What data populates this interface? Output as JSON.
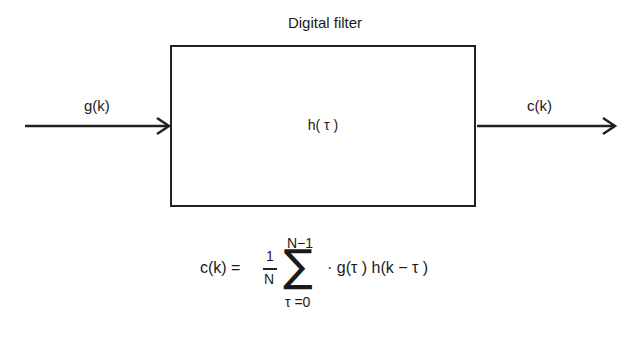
{
  "diagram": {
    "title": "Digital filter",
    "block_label": "h( τ )",
    "input_label": "g(k)",
    "output_label": "c(k)",
    "equation": {
      "lhs": "c(k) =",
      "fraction_numerator": "1",
      "fraction_denominator": "N",
      "sum_symbol": "∑",
      "sum_upper": "N−1",
      "sum_lower": "τ =0",
      "summand": "· g(τ ) h(k − τ )"
    },
    "colors": {
      "line": "#222222",
      "background": "#ffffff"
    }
  }
}
